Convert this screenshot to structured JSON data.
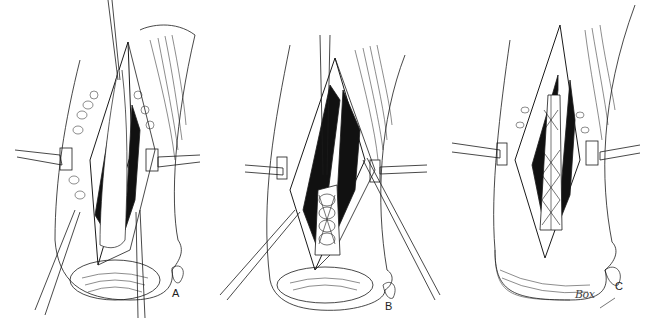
{
  "figure": {
    "panels": [
      {
        "id": "A",
        "label": "A",
        "description": "Incision with retractors exposing tendon, sutures passed"
      },
      {
        "id": "B",
        "label": "B",
        "description": "Retracted wound with cross-stitched repair and guide wires"
      },
      {
        "id": "C",
        "label": "C",
        "description": "Completed lattice-weave repair within retracted incision"
      }
    ],
    "signature": "Box",
    "colors": {
      "ink": "#1a1a1a",
      "background": "#ffffff",
      "dark_fill": "#111111"
    }
  }
}
